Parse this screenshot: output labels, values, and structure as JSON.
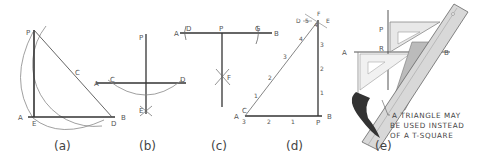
{
  "figure": {
    "panels": [
      {
        "id": "a",
        "caption": "(a)",
        "labels": {
          "P": "P",
          "C": "C",
          "A": "A",
          "E": "E",
          "D": "D",
          "B": "B"
        }
      },
      {
        "id": "b",
        "caption": "(b)",
        "labels": {
          "P": "P",
          "A": "A",
          "C": "C",
          "D": "D",
          "B": "B",
          "E": "E"
        }
      },
      {
        "id": "c",
        "caption": "(c)",
        "labels": {
          "A": "A",
          "D": "D",
          "P": "P",
          "G": "G",
          "B": "B",
          "F": "F"
        }
      },
      {
        "id": "d",
        "caption": "(d)",
        "labels": {
          "D": "D",
          "E": "E",
          "F": "F",
          "A": "A",
          "C": "C",
          "B": "B",
          "P": "P",
          "n5": "5",
          "n4": "4",
          "n3": "3",
          "n2": "2",
          "n1": "1",
          "h4": "4",
          "h3": "3",
          "h2": "2",
          "h1": "1",
          "b3": "3",
          "b2": "2",
          "b1": "1"
        }
      },
      {
        "id": "e",
        "caption": "(e)",
        "labels": {
          "P": "P",
          "R": "R",
          "A": "A",
          "B": "B"
        },
        "note": [
          "A TRIANGLE MAY",
          "BE USED INSTEAD",
          "OF A T-SQUARE"
        ]
      }
    ]
  }
}
